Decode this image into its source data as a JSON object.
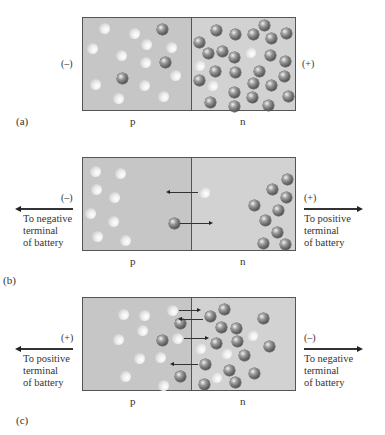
{
  "figure": {
    "panels": [
      {
        "id": "a",
        "caption": "(a)",
        "left_polarity": "(–)",
        "right_polarity": "(+)",
        "p_label": "p",
        "n_label": "n",
        "left_terminal_text": "",
        "right_terminal_text": "",
        "box_top": 17,
        "holes": [
          [
            103,
            27
          ],
          [
            133,
            32
          ],
          [
            145,
            43
          ],
          [
            170,
            46
          ],
          [
            91,
            47
          ],
          [
            120,
            54
          ],
          [
            144,
            61
          ],
          [
            174,
            74
          ],
          [
            94,
            83
          ],
          [
            143,
            84
          ],
          [
            117,
            97
          ],
          [
            162,
            95
          ],
          [
            249,
            51
          ],
          [
            198,
            64
          ],
          [
            211,
            84
          ]
        ],
        "electrons": [
          [
            161,
            28
          ],
          [
            164,
            61
          ],
          [
            121,
            77
          ],
          [
            215,
            29
          ],
          [
            234,
            33
          ],
          [
            252,
            33
          ],
          [
            263,
            24
          ],
          [
            270,
            37
          ],
          [
            285,
            32
          ],
          [
            198,
            41
          ],
          [
            207,
            52
          ],
          [
            221,
            50
          ],
          [
            233,
            56
          ],
          [
            269,
            54
          ],
          [
            284,
            60
          ],
          [
            214,
            70
          ],
          [
            234,
            71
          ],
          [
            258,
            70
          ],
          [
            198,
            79
          ],
          [
            252,
            82
          ],
          [
            270,
            84
          ],
          [
            283,
            75
          ],
          [
            233,
            91
          ],
          [
            251,
            96
          ],
          [
            209,
            101
          ],
          [
            233,
            105
          ],
          [
            267,
            104
          ],
          [
            287,
            95
          ]
        ],
        "small_arrows": []
      },
      {
        "id": "b",
        "caption": "(b)",
        "left_polarity": "(–)",
        "right_polarity": "(+)",
        "p_label": "p",
        "n_label": "n",
        "left_terminal_text": "To negative\nterminal\nof battery",
        "right_terminal_text": "To positive\nterminal\nof battery",
        "box_top": 157,
        "holes": [
          [
            94,
            170
          ],
          [
            119,
            172
          ],
          [
            95,
            188
          ],
          [
            113,
            196
          ],
          [
            89,
            212
          ],
          [
            112,
            220
          ],
          [
            96,
            235
          ],
          [
            124,
            239
          ],
          [
            203,
            191
          ]
        ],
        "electrons": [
          [
            173,
            222
          ],
          [
            286,
            178
          ],
          [
            271,
            188
          ],
          [
            285,
            196
          ],
          [
            253,
            204
          ],
          [
            277,
            209
          ],
          [
            264,
            219
          ],
          [
            276,
            231
          ],
          [
            262,
            242
          ],
          [
            284,
            243
          ]
        ],
        "small_arrows": [
          {
            "y": 191,
            "x1": 168,
            "x2": 197,
            "dir": "left"
          },
          {
            "y": 222,
            "x1": 179,
            "x2": 209,
            "dir": "right"
          }
        ]
      },
      {
        "id": "c",
        "caption": "(c)",
        "left_polarity": "(+)",
        "right_polarity": "(–)",
        "p_label": "p",
        "n_label": "n",
        "left_terminal_text": "To positive\nterminal\nof battery",
        "right_terminal_text": "To negative\nterminal\nof battery",
        "box_top": 297,
        "holes": [
          [
            122,
            313
          ],
          [
            143,
            314
          ],
          [
            171,
            309
          ],
          [
            141,
            329
          ],
          [
            117,
            338
          ],
          [
            176,
            337
          ],
          [
            138,
            357
          ],
          [
            159,
            356
          ],
          [
            124,
            375
          ],
          [
            162,
            384
          ],
          [
            251,
            334
          ],
          [
            199,
            347
          ],
          [
            225,
            352
          ],
          [
            215,
            376
          ]
        ],
        "electrons": [
          [
            179,
            322
          ],
          [
            161,
            339
          ],
          [
            179,
            375
          ],
          [
            209,
            315
          ],
          [
            223,
            308
          ],
          [
            262,
            317
          ],
          [
            220,
            326
          ],
          [
            235,
            327
          ],
          [
            215,
            342
          ],
          [
            236,
            340
          ],
          [
            268,
            345
          ],
          [
            243,
            354
          ],
          [
            204,
            363
          ],
          [
            228,
            369
          ],
          [
            253,
            372
          ],
          [
            203,
            383
          ],
          [
            234,
            381
          ]
        ],
        "small_arrows": [
          {
            "y": 309,
            "x1": 178,
            "x2": 197,
            "dir": "right"
          },
          {
            "y": 318,
            "x1": 180,
            "x2": 202,
            "dir": "left"
          },
          {
            "y": 337,
            "x1": 183,
            "x2": 205,
            "dir": "right"
          },
          {
            "y": 363,
            "x1": 172,
            "x2": 197,
            "dir": "left"
          }
        ]
      }
    ],
    "colors": {
      "p_region": "#c6c6c6",
      "n_region": "#d2d2d2",
      "border": "#555555",
      "electron": "#5e5e5e",
      "hole": "#efefef"
    }
  }
}
